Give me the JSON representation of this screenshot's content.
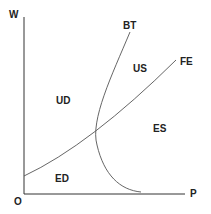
{
  "diagram": {
    "axes": {
      "y_label": "W",
      "x_label": "P",
      "origin_label": "O"
    },
    "curves": [
      {
        "name": "BT",
        "label": "BT"
      },
      {
        "name": "FE",
        "label": "FE"
      }
    ],
    "regions": {
      "ud": "UD",
      "us": "US",
      "es": "ES",
      "ed": "ED"
    },
    "colors": {
      "axis": "#333333",
      "curve": "#555555",
      "text": "#222222"
    }
  }
}
